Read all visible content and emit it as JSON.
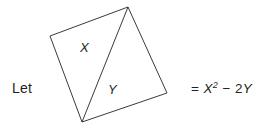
{
  "expression": {
    "prefix_label": "Let",
    "equals_expression": {
      "full_text": "= X² − 2Y",
      "equals_sign": "=",
      "term1_base": "X",
      "term1_exponent": "2",
      "operator": "−",
      "term2_coefficient": "2",
      "term2_variable": "Y"
    }
  },
  "figure": {
    "shape_name": "quadrilateral",
    "region_x_label": "X",
    "region_y_label": "Y",
    "stroke_color": "#3b3b3b",
    "fill_color": "#ffffff",
    "vertices": {
      "left": "50,36",
      "top": "128,7",
      "right": "167,93",
      "bottom": "82,122"
    },
    "diagonal": "128,7 82,122"
  },
  "colors": {
    "text": "#231f20",
    "background": "#ffffff",
    "line": "#3b3b3b"
  }
}
